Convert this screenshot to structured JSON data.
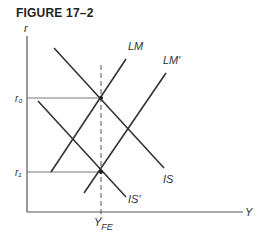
{
  "figure": {
    "title": "FIGURE 17–2"
  },
  "axes": {
    "y_label": "r",
    "x_label": "Y",
    "y_ticks": [
      {
        "label": "r₀",
        "y": 98
      },
      {
        "label": "r₁",
        "y": 172
      }
    ],
    "x_ticks": [
      {
        "label": "Y",
        "sub": "FE",
        "x": 101
      }
    ]
  },
  "curves": {
    "LM": {
      "label": "LM"
    },
    "LM_prime": {
      "label": "LM′"
    },
    "IS": {
      "label": "IS"
    },
    "IS_prime": {
      "label": "IS′"
    }
  },
  "colors": {
    "line": "#333333",
    "guide": "#777777"
  }
}
